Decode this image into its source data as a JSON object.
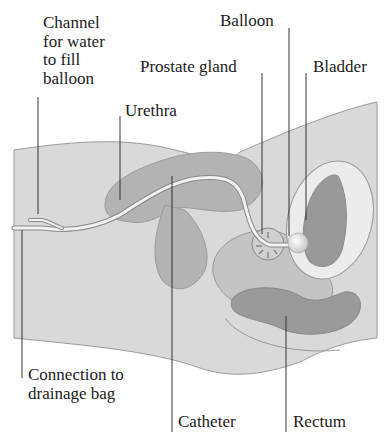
{
  "labels": {
    "channel": "Channel\nfor water\nto fill\nballoon",
    "urethra": "Urethra",
    "prostate": "Prostate gland",
    "balloon": "Balloon",
    "bladder": "Bladder",
    "connection": "Connection to\ndrainage bag",
    "catheter": "Catheter",
    "rectum": "Rectum"
  },
  "colors": {
    "body_fill": "#d9d9d9",
    "body_stroke": "#9a9a9a",
    "organ_fill": "#b3b3b3",
    "organ_dark": "#999999",
    "bladder_wall": "#ececec",
    "catheter": "#f2f2f2",
    "leader": "#333333",
    "text": "#1a1a1a"
  }
}
